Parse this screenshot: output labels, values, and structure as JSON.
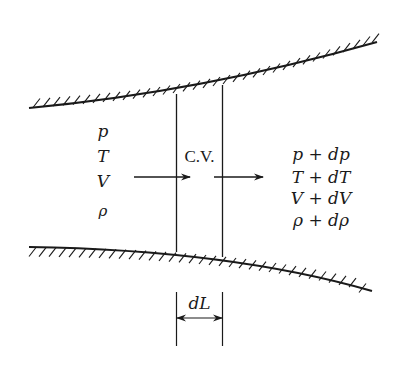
{
  "diagram": {
    "type": "control-volume-flow-in-duct",
    "control_volume_label": "C.V.",
    "inlet_properties": [
      "p",
      "T",
      "V",
      "ρ"
    ],
    "outlet_properties": [
      "p + dp",
      "T + dT",
      "V + dV",
      "ρ + dρ"
    ],
    "length_label": "dL",
    "colors": {
      "ink": "#1a1a1a",
      "background": "#ffffff"
    }
  }
}
